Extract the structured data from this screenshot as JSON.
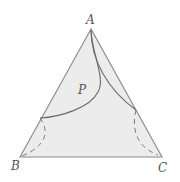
{
  "diagram": {
    "type": "ternary-phase-diagram",
    "vertices": {
      "top": "A",
      "bottom_left": "B",
      "bottom_right": "C"
    },
    "region_label": "P",
    "colors": {
      "fill": "#ececec",
      "edge": "#8a8a8a",
      "curve": "#6a6a6a",
      "dashed": "#7a7a7a",
      "label": "#555555"
    }
  }
}
